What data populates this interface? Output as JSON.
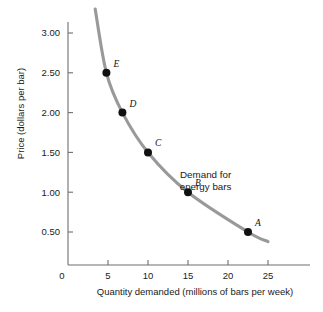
{
  "chart_data": {
    "type": "line",
    "title": "",
    "subtitle": "",
    "xlabel": "Quantity demanded (millions of bars per week)",
    "ylabel": "Price (dollars per bar)",
    "xlim": [
      0,
      27.5
    ],
    "ylim": [
      0,
      3.25
    ],
    "grid": false,
    "legend_position": "inline-annotation",
    "x_ticks": [
      "0",
      "5",
      "10",
      "15",
      "20",
      "25"
    ],
    "x_tick_values": [
      0,
      5,
      10,
      15,
      20,
      25
    ],
    "y_ticks": [
      "0.50",
      "1.00",
      "1.50",
      "2.00",
      "2.50",
      "3.00"
    ],
    "y_tick_values": [
      0.5,
      1.0,
      1.5,
      2.0,
      2.5,
      3.0
    ],
    "origin_label": "0",
    "series": [
      {
        "name": "Demand for energy bars",
        "color": "#999999",
        "curve_start": {
          "x": 3.4,
          "y": 3.3
        },
        "curve_end": {
          "x": 25.0,
          "y": 0.38
        },
        "points": [
          {
            "label": "A",
            "x": 22.5,
            "y": 0.5,
            "label_dx": 7,
            "label_dy": -6
          },
          {
            "label": "B",
            "x": 15.0,
            "y": 1.0,
            "label_dx": 7,
            "label_dy": -6
          },
          {
            "label": "C",
            "x": 10.0,
            "y": 1.5,
            "label_dx": 7,
            "label_dy": -6
          },
          {
            "label": "D",
            "x": 6.8,
            "y": 2.0,
            "label_dx": 7,
            "label_dy": -6
          },
          {
            "label": "E",
            "x": 4.8,
            "y": 2.5,
            "label_dx": 7,
            "label_dy": -6
          }
        ]
      }
    ],
    "annotations": [
      {
        "name": "demand-curve-label",
        "line1": "Demand for",
        "line2": "energy bars",
        "x": 17.2,
        "y": 1.18
      }
    ],
    "colors": {
      "curve": "#999999",
      "axis": "#6f6f6f",
      "point": "#111111",
      "text": "#1a1a1a",
      "background": "#ffffff"
    }
  }
}
